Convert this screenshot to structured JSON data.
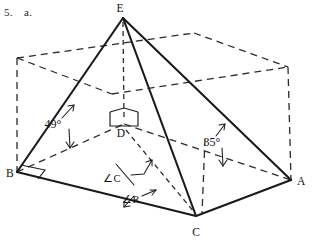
{
  "problem": {
    "number": "5.",
    "part": "a."
  },
  "figure": {
    "caption_vertices": {
      "apex": "E",
      "left": "B",
      "right": "A",
      "front": "C",
      "foot": "D"
    },
    "vertices": [
      {
        "name": "apex-vertex",
        "label": "E",
        "x": 123,
        "y": 18,
        "label_x": 120,
        "label_y": 12
      },
      {
        "name": "left-vertex",
        "label": "B",
        "x": 17,
        "y": 172,
        "label_x": 3,
        "label_y": 177
      },
      {
        "name": "right-vertex",
        "label": "A",
        "x": 291,
        "y": 180,
        "label_x": 297,
        "label_y": 185
      },
      {
        "name": "front-vertex",
        "label": "C",
        "x": 196,
        "y": 216,
        "label_x": 192,
        "label_y": 236
      },
      {
        "name": "foot-vertex",
        "label": "D",
        "x": 124,
        "y": 124,
        "label_x": 118,
        "label_y": 136
      }
    ],
    "angles": [
      {
        "name": "angle-at-b",
        "value": "49",
        "unit": "°",
        "text": "49°",
        "label_x": 53,
        "label_y": 124
      },
      {
        "name": "angle-at-a",
        "value": "35",
        "unit": "°",
        "text": "35°",
        "label_x": 209,
        "label_y": 143
      }
    ],
    "annotations": [
      {
        "name": "angle-c-callout",
        "text": "∠C",
        "label_x": 112,
        "label_y": 179
      },
      {
        "name": "angle-r-callout",
        "text": "∠R",
        "label_x": 124,
        "label_y": 200
      }
    ],
    "colors": {
      "ink": "#1a1a1a",
      "hidden_ink": "#2b2b2b",
      "background": "#ffffff"
    },
    "style": {
      "solid_edges": "pyramid edges EB, EA, EC, BC, CA",
      "dashed_edges": "enclosing rectangular box and interior construction lines",
      "right_angle_marks": 3
    }
  }
}
